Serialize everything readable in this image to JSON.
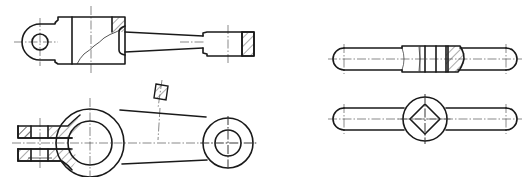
{
  "drawing": {
    "title": "Mechanical part drawings",
    "views": [
      {
        "id": "lever-front-view",
        "label": "Lever - front view (partial section)"
      },
      {
        "id": "lever-top-view",
        "label": "Lever - top view (partial section with forked end)"
      },
      {
        "id": "arm-removed-section",
        "label": "Removed section of arm"
      },
      {
        "id": "wrench-front-view",
        "label": "Tap wrench - front view (partial section)"
      },
      {
        "id": "wrench-top-view",
        "label": "Tap wrench - top view with square hole"
      }
    ],
    "colors": {
      "line": "#1a1a1a",
      "background": "#ffffff"
    }
  }
}
